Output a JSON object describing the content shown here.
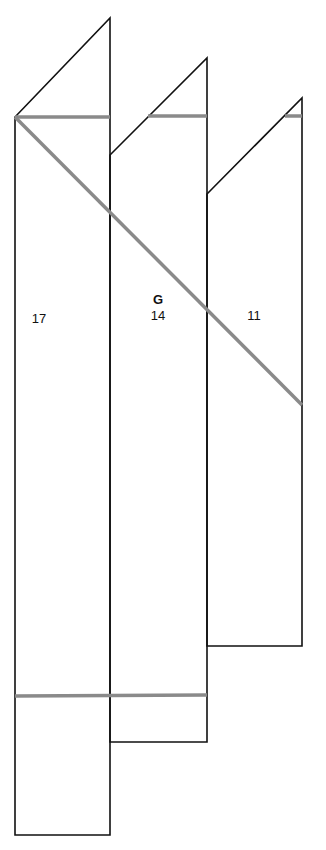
{
  "diagram": {
    "colors": {
      "outline": "#111111",
      "fold_line": "#8a8a8a",
      "background": "#ffffff"
    },
    "panels": [
      {
        "id": "left",
        "label": "17",
        "points": "15,117 110,18 110,835 15,835"
      },
      {
        "id": "middle",
        "label": "14",
        "points": "110,155 207,58 207,742 110,742"
      },
      {
        "id": "right",
        "label": "11",
        "points": "207,194 302,98 302,646 207,646"
      }
    ],
    "title_letter": "G",
    "fold_lines": [
      {
        "x1": 15,
        "y1": 117,
        "x2": 110,
        "y2": 117
      },
      {
        "x1": 148,
        "y1": 116,
        "x2": 207,
        "y2": 116
      },
      {
        "x1": 285,
        "y1": 116,
        "x2": 302,
        "y2": 116
      },
      {
        "x1": 15,
        "y1": 117,
        "x2": 302,
        "y2": 405
      },
      {
        "x1": 15,
        "y1": 696,
        "x2": 207,
        "y2": 695
      }
    ]
  }
}
